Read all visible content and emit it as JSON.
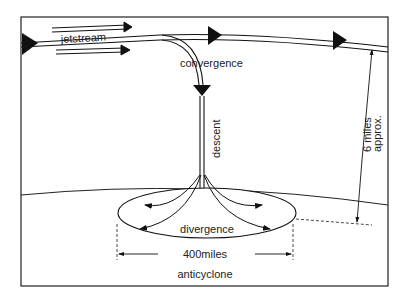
{
  "labels": {
    "jetstream": "jetstream",
    "convergence": "convergence",
    "descent": "descent",
    "divergence": "divergence",
    "width": "400miles",
    "anticyclone": "anticyclone",
    "height_line1": "6 miles",
    "height_line2": "approx."
  },
  "colors": {
    "ink": "#111111",
    "background": "#ffffff"
  }
}
